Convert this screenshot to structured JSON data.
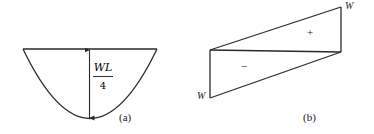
{
  "figure": {
    "panel_a": {
      "caption": "(a)",
      "shape": "parabolic bending-moment diagram",
      "dimension_label_numerator": "WL",
      "dimension_label_denominator": "4"
    },
    "panel_b": {
      "caption": "(b)",
      "shape": "linear shear-force diagram",
      "top_right_label": "W",
      "bottom_left_label": "W",
      "positive_sign": "+",
      "negative_sign": "−"
    },
    "colors": {
      "line": "#2a2a2a",
      "background": "#ffffff"
    }
  }
}
